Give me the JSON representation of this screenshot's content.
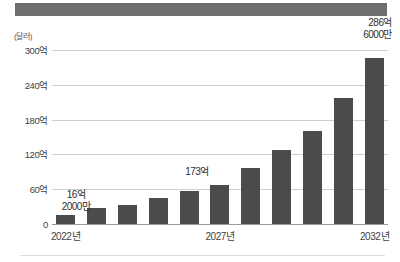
{
  "header": {
    "banner_color": "#6f6f6f"
  },
  "chart_data": {
    "type": "bar",
    "title": "",
    "xlabel": "",
    "ylabel": "(달러)",
    "unit_note": "(달러)",
    "categories": [
      "2022년",
      "2023년",
      "2024년",
      "2025년",
      "2026년",
      "2027년",
      "2028년",
      "2029년",
      "2030년",
      "2031년",
      "2032년"
    ],
    "visible_tick_labels": [
      "2022년",
      "2027년",
      "2032년"
    ],
    "values": [
      16.2,
      28,
      33,
      44,
      57,
      67,
      97,
      127,
      160,
      218,
      286.6
    ],
    "value_unit": "억 달러",
    "ylim": [
      0,
      300
    ],
    "yticks": [
      0,
      60,
      120,
      180,
      240,
      300
    ],
    "ytick_labels": [
      "0",
      "60억",
      "120억",
      "180억",
      "240억",
      "300억"
    ],
    "grid": true,
    "legend": false,
    "bar_color": "#4b4b4b",
    "annotations": [
      {
        "target_index": 0,
        "text_line1": "16억",
        "text_line2": "2000만",
        "value": 16.2
      },
      {
        "target_index": 5,
        "text_line1": "173억",
        "text_line2": "",
        "value": 173
      },
      {
        "target_index": 10,
        "text_line1": "286억",
        "text_line2": "6000만",
        "value": 286.6
      }
    ]
  }
}
